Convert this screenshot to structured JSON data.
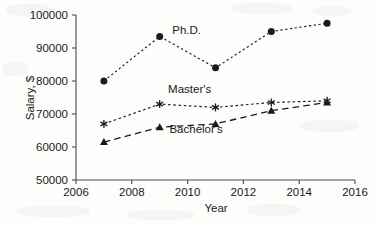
{
  "chart_data": {
    "type": "line",
    "title": "",
    "xlabel": "Year",
    "ylabel": "Salary, $",
    "xlim": [
      2006,
      2016
    ],
    "ylim": [
      50000,
      100000
    ],
    "xticks": [
      2006,
      2008,
      2010,
      2012,
      2014,
      2016
    ],
    "yticks": [
      50000,
      60000,
      70000,
      80000,
      90000,
      100000
    ],
    "xtick_labels": [
      "2006",
      "2008",
      "2010",
      "2012",
      "2014",
      "2016"
    ],
    "ytick_labels": [
      "50000",
      "60000",
      "70000",
      "80000",
      "90000",
      "100000"
    ],
    "grid": false,
    "legend_position": "inline-annotations",
    "x": [
      2007,
      2009,
      2011,
      2013,
      2015
    ],
    "series": [
      {
        "name": "Ph.D.",
        "label": "Ph.D.",
        "marker": "circle",
        "linestyle": "dotted",
        "color": "#1b1b1b",
        "values": [
          80000,
          93500,
          84000,
          95000,
          97500
        ],
        "label_x": 2009.45,
        "label_y": 94200
      },
      {
        "name": "Master's",
        "label": "Master's",
        "marker": "asterisk",
        "linestyle": "dashed",
        "color": "#1b1b1b",
        "values": [
          67000,
          73000,
          72000,
          73500,
          74000
        ],
        "label_x": 2009.3,
        "label_y": 76300
      },
      {
        "name": "Bachelor's",
        "label": "Bachelor's",
        "marker": "triangle",
        "linestyle": "long-dashed",
        "color": "#1b1b1b",
        "values": [
          61500,
          66000,
          67000,
          71000,
          73500
        ],
        "label_x": 2009.35,
        "label_y": 64200
      }
    ]
  },
  "axes": {
    "x_title": "Year",
    "y_title": "Salary, $"
  }
}
